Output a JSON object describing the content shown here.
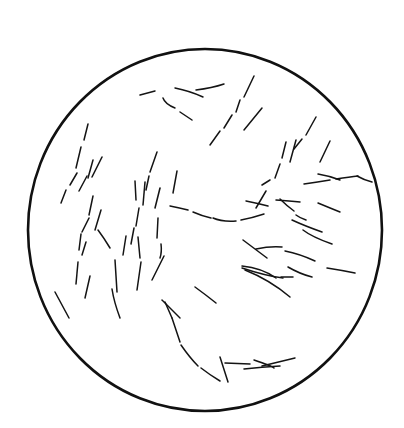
{
  "figure": {
    "background": "#ffffff",
    "ink": "#141414",
    "field": {
      "cx": 205,
      "cy": 230,
      "rx": 177,
      "ry": 181
    },
    "fibers": [
      "M140,95 L155,91",
      "M175,88 Q190,91 203,97",
      "M196,90 Q212,88 224,84",
      "M163,98 Q165,104 175,108",
      "M180,112 L192,120",
      "M254,76 L244,97",
      "M240,100 L236,112",
      "M232,115 L224,128",
      "M220,131 L210,145",
      "M262,108 L244,130",
      "M316,117 L306,135",
      "M302,139 L294,149",
      "M286,142 L282,158",
      "M296,140 L290,162",
      "M280,164 L275,178",
      "M270,180 L262,185",
      "M330,141 L320,162",
      "M318,174 Q330,176 340,180",
      "M304,184 Q318,182 330,180",
      "M336,179 Q350,177 358,176",
      "M357,176 Q364,180 372,182",
      "M266,191 L256,208",
      "M246,201 Q256,203 268,206",
      "M276,200 Q290,201 300,202",
      "M280,199 Q287,206 294,211",
      "M296,215 Q300,218 306,220",
      "M318,203 Q330,208 340,212",
      "M292,220 Q305,226 322,232",
      "M303,230 Q312,237 332,244",
      "M170,206 Q180,208 188,210",
      "M193,212 Q202,216 211,218",
      "M213,218 Q222,222 236,221",
      "M241,220 Q252,218 264,214",
      "M88,124 L84,140",
      "M81,147 L76,168",
      "M77,173 L70,185",
      "M66,190 L61,203",
      "M102,157 L92,177",
      "M93,160 L88,178",
      "M87,176 L79,191",
      "M157,152 L150,172",
      "M149,176 L146,190",
      "M135,181 L136,200",
      "M145,182 L143,205",
      "M160,188 L155,208",
      "M177,171 L173,193",
      "M93,196 L89,215",
      "M89,218 L82,232",
      "M101,210 L95,230",
      "M81,234 L79,250",
      "M98,230 Q104,238 110,248",
      "M139,208 L136,226",
      "M134,228 L131,244",
      "M126,236 L123,255",
      "M158,218 L157,238",
      "M161,244 Q162,252 160,258",
      "M82,255 L86,242",
      "M78,262 L76,284",
      "M138,237 L140,258",
      "M141,262 L137,290",
      "M164,256 L152,280",
      "M115,260 L117,292",
      "M90,276 L85,298",
      "M112,289 Q114,302 120,318",
      "M55,292 L69,318",
      "M162,300 L180,318",
      "M195,287 Q206,295 216,303",
      "M165,302 L172,318",
      "M172,318 Q176,330 180,342",
      "M181,345 Q190,358 198,366",
      "M201,368 Q210,375 220,381",
      "M220,357 L228,382",
      "M225,363 L250,364",
      "M244,369 Q262,367 280,366",
      "M254,360 Q272,366 274,368",
      "M262,366 L295,358",
      "M243,240 L267,258",
      "M256,249 Q270,246 282,247",
      "M285,251 Q300,254 315,261",
      "M242,266 Q262,268 276,278",
      "M242,268 Q266,276 283,278",
      "M245,270 Q270,280 290,297",
      "M281,277 L293,277",
      "M288,267 Q300,274 312,277",
      "M327,268 Q340,270 355,273"
    ]
  }
}
